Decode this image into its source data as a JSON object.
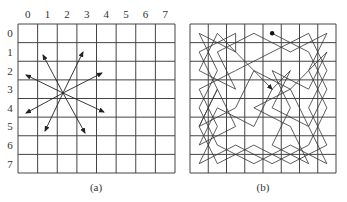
{
  "panel_a": {
    "caption": "(a)",
    "col_labels": [
      "0",
      "1",
      "2",
      "3",
      "4",
      "5",
      "6",
      "7"
    ],
    "row_labels": [
      "0",
      "1",
      "2",
      "3",
      "4",
      "5",
      "6",
      "7"
    ],
    "grid": {
      "x": 18,
      "y": 24,
      "w": 157,
      "h": 149,
      "n": 8
    },
    "knight_origin": {
      "x": 63,
      "y": 93
    },
    "arrows": [
      {
        "x": 43,
        "y": 55
      },
      {
        "x": 83,
        "y": 52
      },
      {
        "x": 26,
        "y": 75
      },
      {
        "x": 102,
        "y": 73
      },
      {
        "x": 26,
        "y": 113
      },
      {
        "x": 104,
        "y": 112
      },
      {
        "x": 45,
        "y": 131
      },
      {
        "x": 85,
        "y": 133
      }
    ]
  },
  "panel_b": {
    "caption": "(b)",
    "grid": {
      "x": 190,
      "y": 24,
      "w": 146,
      "h": 149,
      "n": 8
    },
    "tour_start": [
      0,
      4
    ],
    "tour": [
      [
        0,
        4
      ],
      [
        1,
        6
      ],
      [
        3,
        7
      ],
      [
        5,
        6
      ],
      [
        7,
        7
      ],
      [
        6,
        5
      ],
      [
        7,
        3
      ],
      [
        6,
        1
      ],
      [
        4,
        0
      ],
      [
        2,
        1
      ],
      [
        0,
        0
      ],
      [
        1,
        2
      ],
      [
        0,
        2
      ],
      [
        1,
        0
      ],
      [
        3,
        1
      ],
      [
        5,
        0
      ],
      [
        7,
        1
      ],
      [
        6,
        3
      ],
      [
        7,
        5
      ],
      [
        6,
        7
      ],
      [
        4,
        6
      ],
      [
        2,
        7
      ],
      [
        0,
        6
      ],
      [
        1,
        4
      ],
      [
        2,
        2
      ],
      [
        3,
        0
      ],
      [
        5,
        1
      ],
      [
        7,
        0
      ],
      [
        6,
        2
      ],
      [
        7,
        4
      ],
      [
        6,
        6
      ],
      [
        4,
        7
      ],
      [
        2,
        6
      ],
      [
        0,
        7
      ],
      [
        1,
        5
      ],
      [
        0,
        3
      ],
      [
        1,
        1
      ],
      [
        3,
        2
      ],
      [
        2,
        0
      ],
      [
        0,
        1
      ],
      [
        2,
        3
      ],
      [
        4,
        2
      ],
      [
        5,
        0
      ],
      [
        3,
        1
      ],
      [
        5,
        2
      ],
      [
        6,
        0
      ],
      [
        4,
        1
      ],
      [
        5,
        3
      ],
      [
        3,
        4
      ],
      [
        2,
        5
      ],
      [
        4,
        4
      ],
      [
        5,
        6
      ],
      [
        3,
        5
      ],
      [
        4,
        3
      ],
      [
        5,
        5
      ],
      [
        7,
        6
      ],
      [
        6,
        4
      ],
      [
        4,
        5
      ],
      [
        2,
        4
      ],
      [
        3,
        6
      ],
      [
        1,
        7
      ],
      [
        3,
        5
      ],
      [
        2,
        3
      ],
      [
        3,
        4
      ]
    ]
  }
}
